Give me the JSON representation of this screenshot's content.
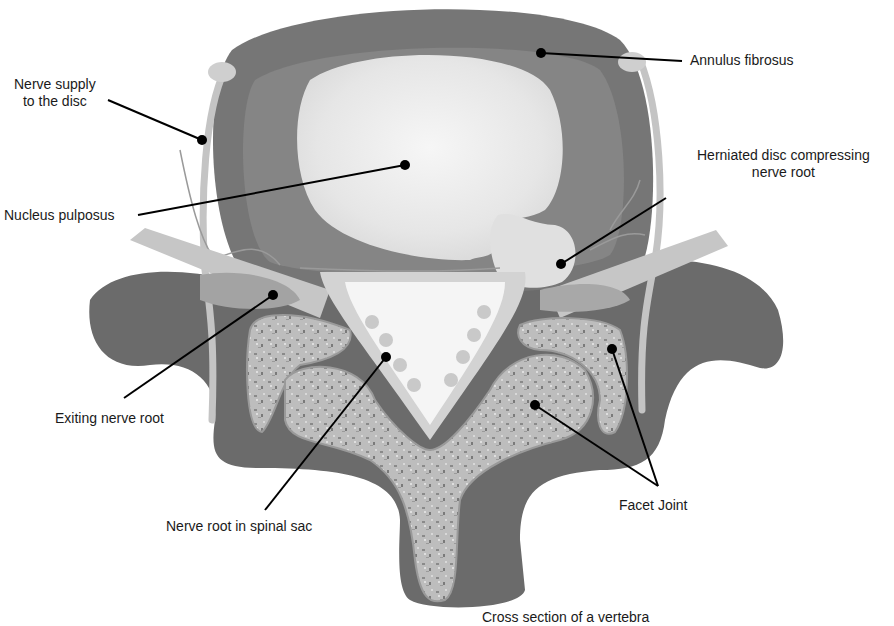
{
  "diagram": {
    "caption": "Cross section of a vertebra",
    "labels": {
      "nerve_supply_line1": "Nerve supply",
      "nerve_supply_line2": "to the disc",
      "annulus_fibrosus": "Annulus fibrosus",
      "herniated_line1": "Herniated disc compressing",
      "herniated_line2": "nerve root",
      "nucleus_pulposus": "Nucleus pulposus",
      "exiting_nerve_root": "Exiting nerve root",
      "nerve_root_spinal_sac": "Nerve root in spinal sac",
      "facet_joint": "Facet Joint"
    },
    "colors": {
      "background": "#ffffff",
      "bone_dark": "#6e6e6e",
      "annulus": "#777777",
      "annulus_inner": "#8a8a8a",
      "nucleus": "#e8e8e8",
      "nerve": "#c8c8c8",
      "spinal_sac": "#f4f4f4",
      "cancellous_bone": "#b9b9b9",
      "leader_line": "#000000"
    }
  }
}
